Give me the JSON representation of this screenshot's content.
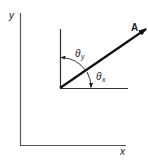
{
  "diagram": {
    "type": "vector-direction-angles",
    "axes": {
      "x_label": "x",
      "y_label": "y"
    },
    "vector": {
      "label": "A",
      "origin": [
        60,
        88
      ],
      "tip": [
        146,
        29
      ]
    },
    "angles": [
      {
        "name": "theta_y",
        "symbol": "θ",
        "subscript": "y",
        "from": "y-direction",
        "to": "A"
      },
      {
        "name": "theta_x",
        "symbol": "θ",
        "subscript": "x",
        "from": "x-direction",
        "to": "A"
      }
    ],
    "colors": {
      "line": "#333333",
      "vector": "#111111",
      "text": "#222222",
      "background": "#ffffff"
    }
  }
}
